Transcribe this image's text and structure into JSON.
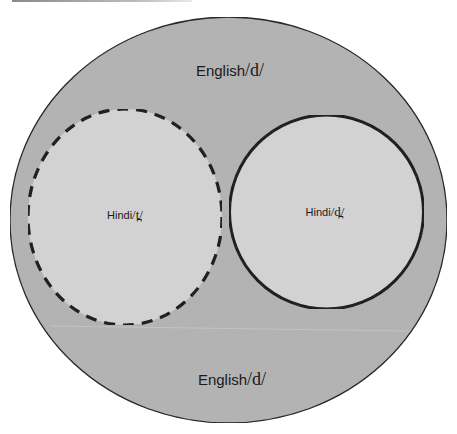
{
  "diagram": {
    "type": "nested-set-diagram",
    "colors": {
      "outer_fill": "#b3b3b3",
      "inner_fill": "#d3d3d3",
      "stroke": "#111111",
      "background": "#ffffff"
    },
    "outer_set": {
      "top_label": {
        "word": "English",
        "phoneme": "/d/"
      },
      "bottom_label": {
        "word": "English",
        "phoneme": "/d/"
      },
      "outline": "solid-thin"
    },
    "inner_sets": [
      {
        "label": {
          "word": "Hindi",
          "phoneme": "/t̪/"
        },
        "outline": "dashed",
        "shape": "ellipse"
      },
      {
        "label": {
          "word": "Hindi",
          "phoneme": "/d̪/"
        },
        "outline": "solid-thick",
        "shape": "circle"
      }
    ]
  }
}
